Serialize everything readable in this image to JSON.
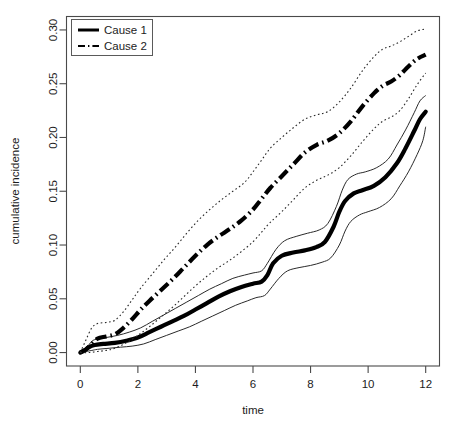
{
  "figure": {
    "title": "",
    "background": "#ffffff",
    "width": 459,
    "height": 432
  },
  "axes": {
    "xlabel": "time",
    "ylabel": "cumulative incidence",
    "x_ticks": [
      "0",
      "2",
      "4",
      "6",
      "8",
      "10",
      "12"
    ],
    "y_ticks": [
      "0.00",
      "0.05",
      "0.10",
      "0.15",
      "0.20",
      "0.25",
      "0.30"
    ]
  },
  "legend": {
    "position": "top-left",
    "entries": [
      {
        "label": "Cause 1",
        "style": "solid",
        "color": "#000000"
      },
      {
        "label": "Cause 2",
        "style": "dashdot",
        "color": "#000000"
      }
    ]
  },
  "chart_data": {
    "type": "line",
    "title": "",
    "xlabel": "time",
    "ylabel": "cumulative incidence",
    "xlim": [
      -0.48,
      12.48
    ],
    "ylim": [
      -0.0125,
      0.3125
    ],
    "xticks": [
      0,
      2,
      4,
      6,
      8,
      10,
      12
    ],
    "yticks": [
      0.0,
      0.05,
      0.1,
      0.15,
      0.2,
      0.25,
      0.3
    ],
    "grid": false,
    "legend_position": "top-left",
    "series": [
      {
        "name": "Cause 1",
        "role": "estimate",
        "linestyle": "solid",
        "linewidth": "thick",
        "color": "#000000",
        "x": [
          0.0,
          0.15,
          0.3,
          0.5,
          0.8,
          1.2,
          1.6,
          2.0,
          2.4,
          2.8,
          3.2,
          3.6,
          4.0,
          4.4,
          4.8,
          5.2,
          5.6,
          6.0,
          6.3,
          6.5,
          6.7,
          7.0,
          7.4,
          7.8,
          8.2,
          8.5,
          8.8,
          9.0,
          9.2,
          9.5,
          9.8,
          10.2,
          10.6,
          11.0,
          11.3,
          11.6,
          11.8,
          12.0
        ],
        "y": [
          0.0,
          0.002,
          0.005,
          0.007,
          0.008,
          0.009,
          0.011,
          0.014,
          0.019,
          0.024,
          0.029,
          0.034,
          0.04,
          0.046,
          0.052,
          0.057,
          0.061,
          0.064,
          0.066,
          0.072,
          0.083,
          0.09,
          0.093,
          0.095,
          0.098,
          0.103,
          0.117,
          0.131,
          0.141,
          0.148,
          0.151,
          0.155,
          0.163,
          0.176,
          0.19,
          0.206,
          0.217,
          0.224
        ]
      },
      {
        "name": "Cause 1 upper CI",
        "role": "upper-ci",
        "linestyle": "solid",
        "linewidth": "thin",
        "color": "#2a2a2a",
        "x": [
          0.0,
          0.2,
          0.35,
          0.5,
          0.9,
          1.3,
          1.7,
          2.1,
          2.5,
          2.9,
          3.3,
          3.7,
          4.1,
          4.5,
          4.9,
          5.3,
          5.7,
          6.0,
          6.3,
          6.5,
          6.8,
          7.1,
          7.5,
          7.9,
          8.3,
          8.6,
          8.9,
          9.1,
          9.3,
          9.6,
          9.9,
          10.3,
          10.7,
          11.0,
          11.3,
          11.6,
          11.8,
          12.0
        ],
        "y": [
          0.0,
          0.004,
          0.009,
          0.012,
          0.014,
          0.016,
          0.019,
          0.023,
          0.029,
          0.035,
          0.041,
          0.047,
          0.053,
          0.059,
          0.064,
          0.069,
          0.072,
          0.074,
          0.076,
          0.083,
          0.096,
          0.104,
          0.108,
          0.111,
          0.114,
          0.12,
          0.136,
          0.151,
          0.161,
          0.166,
          0.168,
          0.172,
          0.18,
          0.193,
          0.207,
          0.223,
          0.234,
          0.239
        ]
      },
      {
        "name": "Cause 1 lower CI",
        "role": "lower-ci",
        "linestyle": "solid",
        "linewidth": "thin",
        "color": "#2a2a2a",
        "x": [
          0.0,
          0.2,
          0.4,
          0.6,
          1.0,
          1.4,
          1.8,
          2.2,
          2.6,
          3.0,
          3.4,
          3.8,
          4.2,
          4.6,
          5.0,
          5.4,
          5.8,
          6.1,
          6.4,
          6.6,
          6.9,
          7.2,
          7.6,
          8.0,
          8.4,
          8.7,
          9.0,
          9.2,
          9.4,
          9.7,
          10.0,
          10.4,
          10.8,
          11.1,
          11.4,
          11.7,
          11.9,
          12.0
        ],
        "y": [
          0.0,
          0.001,
          0.002,
          0.003,
          0.004,
          0.005,
          0.006,
          0.008,
          0.012,
          0.016,
          0.02,
          0.024,
          0.029,
          0.034,
          0.039,
          0.044,
          0.048,
          0.051,
          0.053,
          0.059,
          0.069,
          0.076,
          0.079,
          0.081,
          0.084,
          0.088,
          0.1,
          0.113,
          0.122,
          0.128,
          0.131,
          0.135,
          0.143,
          0.155,
          0.168,
          0.184,
          0.197,
          0.21
        ]
      },
      {
        "name": "Cause 2",
        "role": "estimate",
        "linestyle": "dashdot",
        "linewidth": "thick",
        "color": "#000000",
        "x": [
          0.0,
          0.2,
          0.4,
          0.6,
          0.9,
          1.2,
          1.5,
          1.8,
          2.1,
          2.4,
          2.8,
          3.2,
          3.6,
          4.0,
          4.4,
          4.8,
          5.2,
          5.6,
          6.0,
          6.3,
          6.6,
          7.0,
          7.4,
          7.8,
          8.2,
          8.6,
          9.0,
          9.4,
          9.8,
          10.2,
          10.5,
          10.8,
          11.1,
          11.4,
          11.7,
          12.0
        ],
        "y": [
          0.0,
          0.003,
          0.008,
          0.013,
          0.015,
          0.017,
          0.023,
          0.031,
          0.04,
          0.048,
          0.058,
          0.068,
          0.079,
          0.09,
          0.1,
          0.108,
          0.115,
          0.123,
          0.133,
          0.143,
          0.153,
          0.164,
          0.175,
          0.186,
          0.193,
          0.197,
          0.204,
          0.215,
          0.229,
          0.241,
          0.248,
          0.252,
          0.258,
          0.266,
          0.273,
          0.277
        ]
      },
      {
        "name": "Cause 2 upper CI",
        "role": "upper-ci",
        "linestyle": "dotted",
        "linewidth": "thin",
        "color": "#2a2a2a",
        "x": [
          0.0,
          0.2,
          0.4,
          0.6,
          0.9,
          1.2,
          1.5,
          1.8,
          2.1,
          2.5,
          2.9,
          3.3,
          3.7,
          4.1,
          4.5,
          4.9,
          5.3,
          5.7,
          6.0,
          6.3,
          6.6,
          7.0,
          7.4,
          7.8,
          8.2,
          8.6,
          9.0,
          9.4,
          9.8,
          10.2,
          10.5,
          10.8,
          11.1,
          11.4,
          11.7,
          12.0
        ],
        "y": [
          0.0,
          0.012,
          0.023,
          0.027,
          0.028,
          0.03,
          0.038,
          0.049,
          0.06,
          0.073,
          0.086,
          0.098,
          0.111,
          0.123,
          0.133,
          0.142,
          0.15,
          0.158,
          0.168,
          0.179,
          0.19,
          0.2,
          0.209,
          0.217,
          0.221,
          0.224,
          0.233,
          0.246,
          0.262,
          0.275,
          0.282,
          0.285,
          0.289,
          0.294,
          0.299,
          0.301
        ]
      },
      {
        "name": "Cause 2 lower CI",
        "role": "lower-ci",
        "linestyle": "dotted",
        "linewidth": "thin",
        "color": "#2a2a2a",
        "x": [
          0.0,
          0.3,
          0.6,
          0.9,
          1.2,
          1.6,
          2.0,
          2.4,
          2.8,
          3.2,
          3.6,
          4.0,
          4.4,
          4.8,
          5.2,
          5.6,
          6.0,
          6.3,
          6.6,
          7.0,
          7.4,
          7.8,
          8.2,
          8.6,
          9.0,
          9.4,
          9.8,
          10.2,
          10.5,
          10.8,
          11.1,
          11.4,
          11.7,
          12.0
        ],
        "y": [
          0.0,
          0.0,
          0.001,
          0.002,
          0.004,
          0.009,
          0.016,
          0.024,
          0.033,
          0.042,
          0.052,
          0.062,
          0.071,
          0.079,
          0.086,
          0.094,
          0.103,
          0.112,
          0.121,
          0.131,
          0.142,
          0.153,
          0.16,
          0.165,
          0.172,
          0.183,
          0.196,
          0.208,
          0.215,
          0.219,
          0.225,
          0.236,
          0.249,
          0.26
        ]
      }
    ]
  }
}
